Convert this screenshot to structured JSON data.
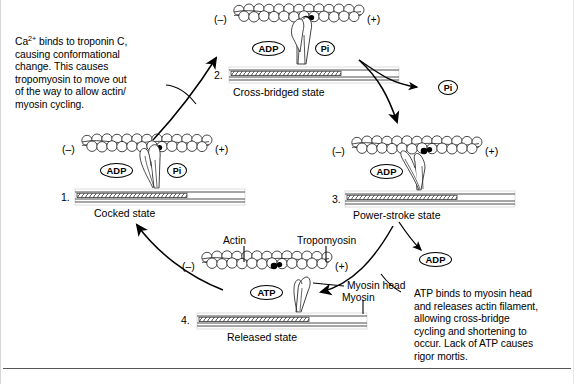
{
  "diagram": {
    "type": "cycle-diagram",
    "background": "#ffffff",
    "ink": "#000000",
    "rule_color": "#58585a"
  },
  "annotations": {
    "left_note": "Ca2+ binds to troponin C, causing conformational change. This causes tropomyosin to move out of the way to allow actin/ myosin cycling.",
    "left_note_lines": [
      "binds to troponin C,",
      "causing conformational",
      "change. This causes",
      "tropomyosin to move out",
      "of the way to allow actin/",
      "myosin cycling."
    ],
    "left_note_prefix": "Ca",
    "left_note_superscript": "2+",
    "right_note_lines": [
      "ATP binds to myosin head",
      "and releases actin filament,",
      "allowing cross-bridge",
      "cycling and shortening to",
      "occur. Lack of ATP causes",
      "rigor mortis."
    ]
  },
  "states": [
    {
      "number": "1.",
      "name": "Cocked state",
      "minus": "(–)",
      "plus": "(+)",
      "molecules": [
        "ADP",
        "Pi"
      ]
    },
    {
      "number": "2.",
      "name": "Cross-bridged state",
      "minus": "(–)",
      "plus": "(+)",
      "molecules": [
        "ADP",
        "Pi"
      ]
    },
    {
      "number": "3.",
      "name": "Power-stroke state",
      "minus": "(–)",
      "plus": "(+)",
      "molecules": [
        "ADP"
      ]
    },
    {
      "number": "4.",
      "name": "Released state",
      "minus": "(–)",
      "plus": "(+)",
      "molecules": [
        "ATP"
      ]
    }
  ],
  "free_molecules": {
    "pi_released": "Pi",
    "adp_released": "ADP"
  },
  "part_labels": {
    "actin": "Actin",
    "tropomyosin": "Tropomyosin",
    "myosin_head": "Myosin head",
    "myosin": "Myosin"
  }
}
